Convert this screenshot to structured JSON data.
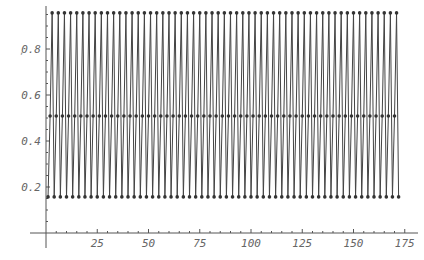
{
  "chart_data": {
    "type": "line",
    "title": "",
    "xlabel": "",
    "ylabel": "",
    "xlim": [
      0,
      175
    ],
    "ylim": [
      0,
      0.97
    ],
    "grid": false,
    "legend": null,
    "x_ticks": [
      25,
      50,
      75,
      100,
      125,
      150,
      175
    ],
    "y_ticks": [
      0.2,
      0.4,
      0.6,
      0.8
    ],
    "x_tick_labels": [
      "25",
      "50",
      "75",
      "100",
      "125",
      "150",
      "175"
    ],
    "y_tick_labels": [
      "0.2",
      "0.4",
      "0.6",
      "0.8"
    ],
    "series": [
      {
        "name": "orbit",
        "description": "period-3 oscillation repeating over n = 1..172",
        "cycle": [
          0.157,
          0.509,
          0.957
        ],
        "x_start": 1,
        "x_end": 172,
        "markers": true,
        "color": "#333333"
      }
    ],
    "stray_mark": ","
  },
  "style": {
    "line_color": "#444444",
    "marker_color": "#333333",
    "axis_color": "#555555",
    "label_color": "#666666"
  }
}
